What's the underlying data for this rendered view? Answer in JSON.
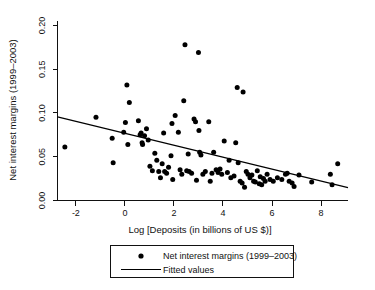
{
  "chart_data": {
    "type": "scatter",
    "title": "",
    "xlabel": "Log [Deposits (in billions of US $)]",
    "ylabel": "Net interest margins (1999–2003)",
    "xlim": [
      -2.75,
      9.1
    ],
    "ylim": [
      0.0,
      0.205
    ],
    "xticks": [
      "-2",
      "0",
      "2",
      "4",
      "6",
      "8"
    ],
    "xtick_values": [
      -2,
      0,
      2,
      4,
      6,
      8
    ],
    "yticks": [
      "0.00",
      "0.05",
      "0.10",
      "0.15",
      "0.20"
    ],
    "ytick_values": [
      0.0,
      0.05,
      0.1,
      0.15,
      0.2
    ],
    "grid": false,
    "legend_position": "below-axes",
    "series": [
      {
        "name": "Net interest margins (1999–2003)",
        "marker": "filled-circle",
        "color": "#000000",
        "points": [
          [
            -2.45,
            0.061
          ],
          [
            -1.18,
            0.095
          ],
          [
            -0.52,
            0.071
          ],
          [
            -0.48,
            0.043
          ],
          [
            -0.05,
            0.078
          ],
          [
            0.02,
            0.089
          ],
          [
            0.08,
            0.132
          ],
          [
            0.12,
            0.064
          ],
          [
            0.18,
            0.112
          ],
          [
            0.55,
            0.091
          ],
          [
            0.62,
            0.075
          ],
          [
            0.66,
            0.077
          ],
          [
            0.7,
            0.066
          ],
          [
            0.72,
            0.064
          ],
          [
            0.8,
            0.074
          ],
          [
            0.88,
            0.082
          ],
          [
            0.95,
            0.069
          ],
          [
            1.02,
            0.039
          ],
          [
            1.12,
            0.034
          ],
          [
            1.22,
            0.054
          ],
          [
            1.3,
            0.046
          ],
          [
            1.38,
            0.033
          ],
          [
            1.45,
            0.026
          ],
          [
            1.52,
            0.042
          ],
          [
            1.58,
            0.077
          ],
          [
            1.62,
            0.033
          ],
          [
            1.7,
            0.031
          ],
          [
            1.78,
            0.038
          ],
          [
            1.88,
            0.051
          ],
          [
            1.92,
            0.088
          ],
          [
            1.95,
            0.024
          ],
          [
            2.05,
            0.097
          ],
          [
            2.18,
            0.078
          ],
          [
            2.25,
            0.035
          ],
          [
            2.32,
            0.03
          ],
          [
            2.4,
            0.114
          ],
          [
            2.45,
            0.178
          ],
          [
            2.52,
            0.034
          ],
          [
            2.58,
            0.053
          ],
          [
            2.62,
            0.033
          ],
          [
            2.72,
            0.031
          ],
          [
            2.82,
            0.093
          ],
          [
            2.88,
            0.09
          ],
          [
            2.92,
            0.023
          ],
          [
            3.0,
            0.169
          ],
          [
            3.02,
            0.08
          ],
          [
            3.05,
            0.055
          ],
          [
            3.1,
            0.052
          ],
          [
            3.18,
            0.03
          ],
          [
            3.28,
            0.033
          ],
          [
            3.42,
            0.09
          ],
          [
            3.48,
            0.022
          ],
          [
            3.55,
            0.031
          ],
          [
            3.62,
            0.055
          ],
          [
            3.72,
            0.035
          ],
          [
            3.8,
            0.032
          ],
          [
            3.88,
            0.036
          ],
          [
            3.95,
            0.03
          ],
          [
            4.05,
            0.068
          ],
          [
            4.18,
            0.032
          ],
          [
            4.25,
            0.046
          ],
          [
            4.32,
            0.026
          ],
          [
            4.45,
            0.028
          ],
          [
            4.52,
            0.066
          ],
          [
            4.58,
            0.129
          ],
          [
            4.62,
            0.043
          ],
          [
            4.7,
            0.022
          ],
          [
            4.78,
            0.02
          ],
          [
            4.82,
            0.124
          ],
          [
            4.88,
            0.015
          ],
          [
            4.95,
            0.033
          ],
          [
            5.02,
            0.03
          ],
          [
            5.1,
            0.026
          ],
          [
            5.18,
            0.029
          ],
          [
            5.25,
            0.022
          ],
          [
            5.32,
            0.021
          ],
          [
            5.4,
            0.034
          ],
          [
            5.48,
            0.019
          ],
          [
            5.52,
            0.027
          ],
          [
            5.58,
            0.018
          ],
          [
            5.65,
            0.025
          ],
          [
            5.72,
            0.022
          ],
          [
            5.8,
            0.03
          ],
          [
            5.92,
            0.024
          ],
          [
            6.05,
            0.022
          ],
          [
            6.22,
            0.026
          ],
          [
            6.4,
            0.024
          ],
          [
            6.55,
            0.03
          ],
          [
            6.62,
            0.031
          ],
          [
            6.7,
            0.022
          ],
          [
            6.82,
            0.02
          ],
          [
            6.9,
            0.016
          ],
          [
            7.1,
            0.029
          ],
          [
            7.62,
            0.021
          ],
          [
            8.38,
            0.03
          ],
          [
            8.45,
            0.018
          ],
          [
            8.68,
            0.042
          ]
        ]
      }
    ],
    "fitted_line": {
      "name": "Fitted values",
      "color": "#000000",
      "x_start": -2.75,
      "y_start": 0.0955,
      "x_end": 9.1,
      "y_end": 0.0147
    }
  },
  "legend": {
    "entries": [
      {
        "label": "Net interest margins (1999–2003)",
        "marker": "filled-circle"
      },
      {
        "label": "Fitted values",
        "marker": "line"
      }
    ]
  }
}
